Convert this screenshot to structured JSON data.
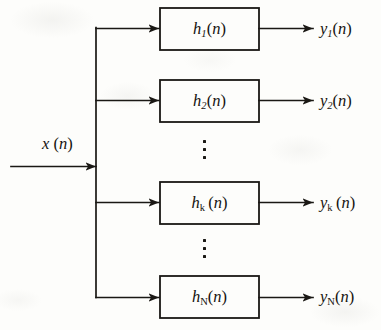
{
  "figure": {
    "type": "block-diagram",
    "line_color": "#1a1814",
    "background_color": "#fdfdfb"
  },
  "input": {
    "label_var": "x",
    "label_arg": "(n)",
    "label_text": "x (n)"
  },
  "branches": [
    {
      "id": "branch-1",
      "block_var": "h",
      "block_sub": "1",
      "block_sub_style": "italic",
      "block_arg": "(n)",
      "block_text": "h1(n)",
      "output_var": "y",
      "output_sub": "1",
      "output_sub_style": "italic",
      "output_arg": "(n)",
      "output_text": "y1(n)"
    },
    {
      "id": "branch-2",
      "block_var": "h",
      "block_sub": "2",
      "block_sub_style": "italic",
      "block_arg": "(n)",
      "block_text": "h2(n)",
      "output_var": "y",
      "output_sub": "2",
      "output_sub_style": "italic",
      "output_arg": "(n)",
      "output_text": "y2(n)"
    },
    {
      "id": "branch-k",
      "block_var": "h",
      "block_sub": "k",
      "block_sub_style": "upright",
      "block_arg": "(n)",
      "block_text": "hk (n)",
      "output_var": "y",
      "output_sub": "k",
      "output_sub_style": "upright",
      "output_arg": "(n)",
      "output_text": "yk (n)"
    },
    {
      "id": "branch-N",
      "block_var": "h",
      "block_sub": "N",
      "block_sub_style": "upright",
      "block_arg": "(n)",
      "block_text": "hN(n)",
      "output_var": "y",
      "output_sub": "N",
      "output_sub_style": "upright",
      "output_arg": "(n)",
      "output_text": "yN(n)"
    }
  ],
  "ellipses": [
    {
      "id": "ellipsis-upper",
      "glyph": "vertical-ellipsis",
      "dot_count": 3
    },
    {
      "id": "ellipsis-lower",
      "glyph": "vertical-ellipsis",
      "dot_count": 3
    }
  ]
}
